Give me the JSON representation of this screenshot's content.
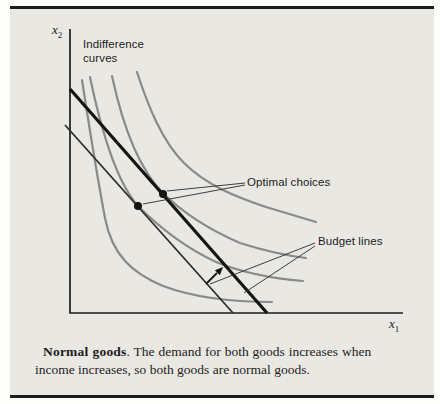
{
  "figure": {
    "plot": {
      "y_axis_label": {
        "letter": "x",
        "sub": "2"
      },
      "x_axis_label": {
        "letter": "x",
        "sub": "1"
      },
      "labels": {
        "indifference_line1": "Indifference",
        "indifference_line2": "curves",
        "optimal_choices": "Optimal choices",
        "budget_lines": "Budget lines"
      },
      "elements": {
        "indifference_curve_count": 4,
        "budget_line_count": 2,
        "optimal_point_count": 2,
        "shift_arrow_direction": "up-right"
      }
    },
    "caption": {
      "bold": "Normal goods",
      "line1_rest": ".  The demand for both goods increases when",
      "line2": "income increases, so both goods are normal goods."
    },
    "colors": {
      "panel_background": "#e9e8e3",
      "rule": "#1c1c1c",
      "axis": "#1c1c1c",
      "indifference_curve": "#8a8a8a",
      "budget_line": "#141414",
      "pointer_line": "#2a2a2a",
      "text": "#1c1c1c"
    }
  }
}
